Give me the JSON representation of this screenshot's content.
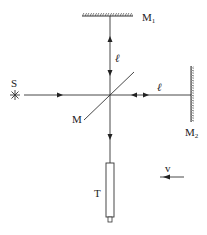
{
  "diagram": {
    "type": "Michelson interferometer",
    "labels": {
      "source": "S",
      "mirror1": "M",
      "mirror1_sub": "1",
      "mirror2": "M",
      "mirror2_sub": "2",
      "beam_splitter": "M",
      "telescope": "T",
      "arm_length_vertical": "ℓ",
      "arm_length_horizontal": "ℓ",
      "velocity": "v"
    },
    "colors": {
      "line": "#333333",
      "background": "#ffffff"
    }
  }
}
